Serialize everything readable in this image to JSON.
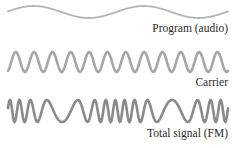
{
  "figure": {
    "waves": [
      {
        "id": "program",
        "label": "Program (audio)",
        "color": "#b4b4b4",
        "stroke_width": 1.8,
        "cycles": 2,
        "y_center": 12,
        "amplitude": 6
      },
      {
        "id": "carrier",
        "label": "Carrier",
        "color": "#a6a6a6",
        "stroke_width": 2.6,
        "cycles": 12,
        "y_center": 62,
        "amplitude": 10
      },
      {
        "id": "fm",
        "label": "Total signal (FM)",
        "color": "#8a8a8a",
        "stroke_width": 2.6,
        "y_center": 111,
        "amplitude": 11
      }
    ],
    "x_start": 8,
    "x_end": 228
  }
}
